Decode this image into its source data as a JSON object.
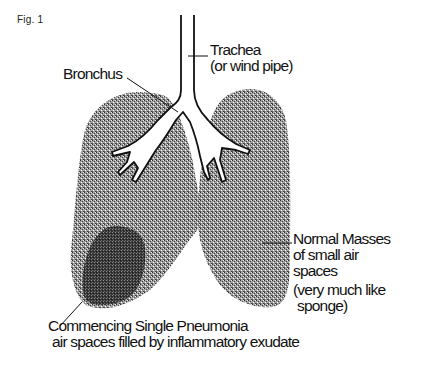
{
  "figure": {
    "label": "Fig. 1"
  },
  "labels": {
    "trachea": {
      "line1": "Trachea",
      "line2": "(or wind pipe)"
    },
    "bronchus": {
      "line1": "Bronchus"
    },
    "normal": {
      "line1": "Normal Masses",
      "line2": "of small air",
      "line3": "spaces",
      "line4": "(very much like",
      "line5": "sponge)"
    },
    "pneumonia": {
      "line1": "Commencing Single Pneumonia",
      "line2": "air spaces filled by inflammatory exudate"
    }
  },
  "colors": {
    "background": "#ffffff",
    "ink": "#111111",
    "lung_stipple": "#555555",
    "pneumonia_stipple": "#1e1e1e"
  }
}
